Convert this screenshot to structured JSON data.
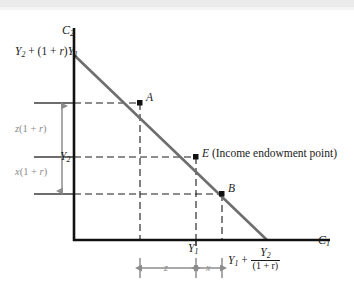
{
  "figure": {
    "type": "intertemporal-budget-constraint-diagram",
    "title": "",
    "axes": {
      "y_axis_label": "C2",
      "y_axis_label_base": "C",
      "y_axis_label_sub": "2",
      "x_axis_label": "C1",
      "x_axis_label_base": "C",
      "x_axis_label_sub": "1"
    },
    "intercepts": {
      "vertical_intercept_label": "Y2 + (1 + r)Y1",
      "vertical_intercept_parts": {
        "y_base": "Y",
        "y_sub": "2",
        "plus": " + (1 + ",
        "rate": "r",
        "close": ")",
        "y1_base": "Y",
        "y1_sub": "1"
      },
      "horizontal_intercept_label": "Y1 + Y2/(1 + r)",
      "horizontal_intercept_parts": {
        "y1_base": "Y",
        "y1_sub": "1",
        "plus": " + ",
        "numerator_base": "Y",
        "numerator_sub": "2",
        "denominator": "(1 + r)"
      }
    },
    "points": [
      {
        "id": "A",
        "label": "A",
        "x_px": 140,
        "y_px": 103,
        "marker": "filled-square"
      },
      {
        "id": "E",
        "label": "E (Income endowment point)",
        "short_label": "E",
        "annotation": " (Income endowment point)",
        "x_px": 196,
        "y_px": 157,
        "marker": "filled-square"
      },
      {
        "id": "B",
        "label": "B",
        "x_px": 222,
        "y_px": 194,
        "marker": "filled-square"
      }
    ],
    "axis_ticks": {
      "y_tick_label": "Y2",
      "y_tick_base": "Y",
      "y_tick_sub": "2",
      "x_tick_label": "Y1",
      "x_tick_base": "Y",
      "x_tick_sub": "1"
    },
    "measurements": {
      "vertical_upper_label": "z(1 + r)",
      "vertical_upper_parts": {
        "var": "z",
        "rest": "(1 + ",
        "rate": "r",
        "close": ")"
      },
      "vertical_lower_label": "x(1 + r)",
      "vertical_lower_parts": {
        "var": "x",
        "rest": "(1 + ",
        "rate": "r",
        "close": ")"
      },
      "horizontal_left_label": "z",
      "horizontal_right_label": "x"
    },
    "colors": {
      "axis": "#1a1a1a",
      "budget_line": "#6e6e6e",
      "dashed_guide": "#1a1a1a",
      "measure_arrow": "#8c8c8c",
      "level_line": "#4d4d4d",
      "marker": "#111111",
      "background": "#ffffff",
      "top_strip": "#ebebeb"
    }
  }
}
